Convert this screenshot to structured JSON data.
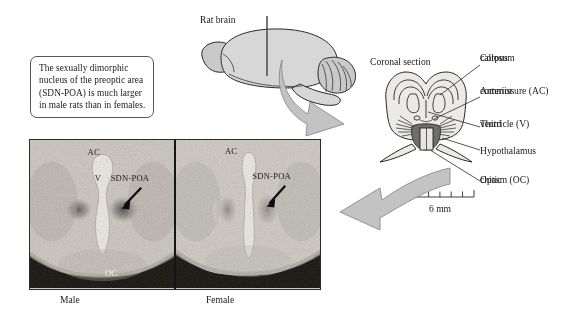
{
  "figure": {
    "title_text": "The sexually dimorphic nucleus of the preoptic area (SDN-POA) is much larger in male rats than in females.",
    "callout": "The sexually dimorphic nucleus of the preoptic area (SDN-POA) is much larger in male rats than in females."
  },
  "diagram": {
    "rat_brain_label": "Rat brain",
    "coronal_label": "Coronal section",
    "scale_bar": {
      "label": "6 mm",
      "ticks": 7,
      "segments": 6
    },
    "leader_labels": [
      {
        "name": "corpus-callosum",
        "line1": "Corpus",
        "line2": "callosum"
      },
      {
        "name": "anterior-commissure",
        "line1": "Anterior",
        "line2": "commissure (AC)"
      },
      {
        "name": "third-ventricle",
        "line1": "Third",
        "line2": "ventricle (V)"
      },
      {
        "name": "hypothalamus",
        "line1": "Hypothalamus",
        "line2": ""
      },
      {
        "name": "optic-chiasm",
        "line1": "Optic",
        "line2": "chiasm (OC)"
      }
    ]
  },
  "micrographs": {
    "male": {
      "caption": "Male",
      "annotations": {
        "ac": "AC",
        "v": "V",
        "sdn": "SDN-POA",
        "oc": "OC"
      }
    },
    "female": {
      "caption": "Female",
      "annotations": {
        "ac": "AC",
        "sdn": "SDN-POA"
      }
    }
  },
  "colors": {
    "ink": "#2a2a2a",
    "brain_fill": "#d7d7d7",
    "section_fill": "#eceae6",
    "arrow_fill": "#c3c3c3",
    "hypothalamus_fill": "#6d6d6d",
    "background": "#ffffff"
  }
}
